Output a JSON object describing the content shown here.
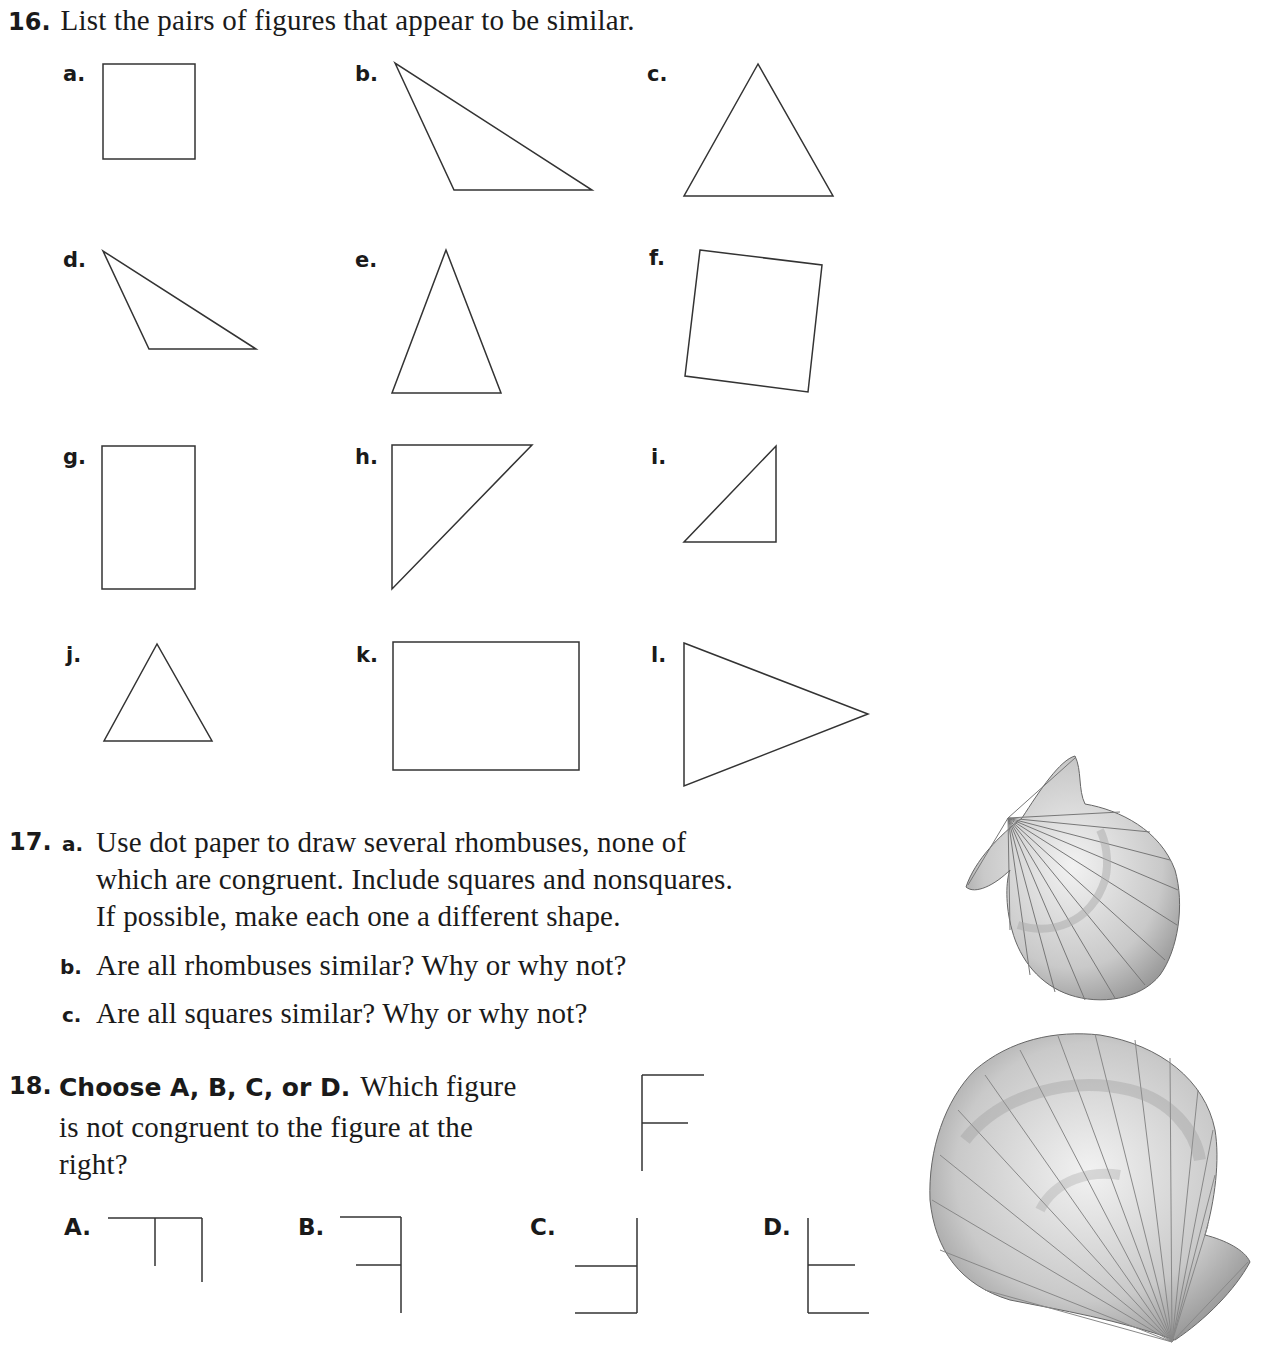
{
  "q16": {
    "number": "16.",
    "prompt": "List the pairs of figures that appear to be similar.",
    "figures": [
      {
        "label": "a.",
        "shape": "rectangle"
      },
      {
        "label": "b.",
        "shape": "obtuse-triangle"
      },
      {
        "label": "c.",
        "shape": "isosceles-triangle"
      },
      {
        "label": "d.",
        "shape": "obtuse-triangle"
      },
      {
        "label": "e.",
        "shape": "isosceles-triangle"
      },
      {
        "label": "f.",
        "shape": "tilted-quadrilateral"
      },
      {
        "label": "g.",
        "shape": "rectangle"
      },
      {
        "label": "h.",
        "shape": "right-triangle"
      },
      {
        "label": "i.",
        "shape": "right-triangle"
      },
      {
        "label": "j.",
        "shape": "isosceles-triangle"
      },
      {
        "label": "k.",
        "shape": "rectangle"
      },
      {
        "label": "l.",
        "shape": "isosceles-triangle"
      }
    ]
  },
  "q17": {
    "number": "17.",
    "parts": [
      {
        "label": "a.",
        "lines": [
          "Use dot paper to draw several rhombuses, none of",
          "which are congruent. Include squares and nonsquares.",
          "If possible, make each one a different shape."
        ]
      },
      {
        "label": "b.",
        "lines": [
          "Are all rhombuses similar? Why or why not?"
        ]
      },
      {
        "label": "c.",
        "lines": [
          "Are all squares similar? Why or why not?"
        ]
      }
    ]
  },
  "q18": {
    "number": "18.",
    "bold_lead": "Choose A, B, C, or D.",
    "lines": [
      "Which figure",
      "is not congruent to the figure at the",
      "right?"
    ],
    "reference_figure": "F-shape",
    "choices": [
      {
        "label": "A."
      },
      {
        "label": "B."
      },
      {
        "label": "C."
      },
      {
        "label": "D."
      }
    ]
  },
  "illustrations": [
    {
      "name": "scallop-shell-small"
    },
    {
      "name": "scallop-shell-large"
    }
  ]
}
